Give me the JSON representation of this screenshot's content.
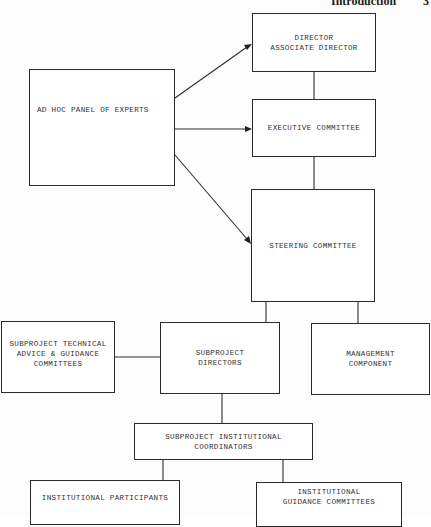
{
  "header": {
    "section": "Introduction",
    "page_number": "3"
  },
  "boxes": {
    "director": {
      "label": "DIRECTOR\nASSOCIATE DIRECTOR"
    },
    "ad_hoc_panel": {
      "label": "AD HOC PANEL OF EXPERTS"
    },
    "executive_committee": {
      "label": "EXECUTIVE COMMITTEE"
    },
    "steering_committee": {
      "label": "STEERING COMMITTEE"
    },
    "technical_advice": {
      "label": "SUBPROJECT TECHNICAL\nADVICE & GUIDANCE\nCOMMITTEES"
    },
    "subproject_directors": {
      "label": "SUBPROJECT\nDIRECTORS"
    },
    "management_component": {
      "label": "MANAGEMENT\nCOMPONENT"
    },
    "institutional_coordinators": {
      "label": "SUBPROJECT INSTITUTIONAL\nCOORDINATORS"
    },
    "institutional_participants": {
      "label": "INSTITUTIONAL PARTICIPANTS"
    },
    "institutional_guidance": {
      "label": "INSTITUTIONAL\nGUIDANCE COMMITTEES"
    }
  },
  "connections": [
    {
      "from": "ad_hoc_panel",
      "to": "director",
      "type": "arrow"
    },
    {
      "from": "ad_hoc_panel",
      "to": "executive_committee",
      "type": "arrow"
    },
    {
      "from": "ad_hoc_panel",
      "to": "steering_committee",
      "type": "arrow"
    },
    {
      "from": "director",
      "to": "executive_committee",
      "type": "line"
    },
    {
      "from": "executive_committee",
      "to": "steering_committee",
      "type": "line"
    },
    {
      "from": "steering_committee",
      "to": "subproject_directors",
      "type": "line"
    },
    {
      "from": "steering_committee",
      "to": "management_component",
      "type": "line"
    },
    {
      "from": "technical_advice",
      "to": "subproject_directors",
      "type": "line"
    },
    {
      "from": "subproject_directors",
      "to": "institutional_coordinators",
      "type": "line"
    },
    {
      "from": "institutional_coordinators",
      "to": "institutional_participants",
      "type": "line"
    },
    {
      "from": "institutional_coordinators",
      "to": "institutional_guidance",
      "type": "line"
    }
  ]
}
